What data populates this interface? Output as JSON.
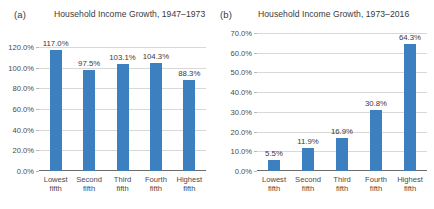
{
  "figure": {
    "background": "#ffffff",
    "bar_color": "#3c80c0",
    "gridline_color": "#d8d8d8",
    "axis_color": "#6b6b6b",
    "text_color": "#3a3a3a"
  },
  "panels": [
    {
      "tag": "(a)",
      "title": "Household Income Growth, 1947–1973"
    },
    {
      "tag": "(b)",
      "title": "Household Income Growth, 1973–2016"
    }
  ],
  "chart_data": [
    {
      "type": "bar",
      "title": "Household Income Growth, 1947–1973",
      "panel_tag": "(a)",
      "categories": [
        "Lowest fifth",
        "Second fifth",
        "Third fifth",
        "Fourth fifth",
        "Highest fifth"
      ],
      "category_lines": [
        [
          "Lowest",
          "fifth"
        ],
        [
          "Second",
          "fifth"
        ],
        [
          "Third",
          "fifth"
        ],
        [
          "Fourth",
          "fifth"
        ],
        [
          "Highest",
          "fifth"
        ]
      ],
      "values": [
        117.0,
        97.5,
        103.1,
        104.3,
        88.3
      ],
      "data_labels": [
        "117.0%",
        "97.5%",
        "103.1%",
        "104.3%",
        "88.3%"
      ],
      "xlabel": "",
      "ylabel": "",
      "ylim": [
        0,
        120
      ],
      "yticks": [
        0,
        20,
        40,
        60,
        80,
        100,
        120
      ],
      "ytick_labels": [
        "0.0%",
        "20.0%",
        "40.0%",
        "60.0%",
        "80.0%",
        "100.0%",
        "120.0%"
      ],
      "grid": true,
      "legend": false,
      "series_color": "#3c80c0"
    },
    {
      "type": "bar",
      "title": "Household Income Growth, 1973–2016",
      "panel_tag": "(b)",
      "categories": [
        "Lowest fifth",
        "Second fifth",
        "Third fifth",
        "Fourth fifth",
        "Highest fifth"
      ],
      "category_lines": [
        [
          "Lowest",
          "fifth"
        ],
        [
          "Second",
          "fifth"
        ],
        [
          "Third",
          "fifth"
        ],
        [
          "Fourth",
          "fifth"
        ],
        [
          "Highest",
          "fifth"
        ]
      ],
      "values": [
        5.5,
        11.9,
        16.9,
        30.8,
        64.3
      ],
      "data_labels": [
        "5.5%",
        "11.9%",
        "16.9%",
        "30.8%",
        "64.3%"
      ],
      "xlabel": "",
      "ylabel": "",
      "ylim": [
        0,
        70
      ],
      "yticks": [
        0,
        10,
        20,
        30,
        40,
        50,
        60,
        70
      ],
      "ytick_labels": [
        "0.0%",
        "10.0%",
        "20.0%",
        "30.0%",
        "40.0%",
        "50.0%",
        "60.0%",
        "70.0%"
      ],
      "grid": true,
      "legend": false,
      "series_color": "#3c80c0"
    }
  ]
}
